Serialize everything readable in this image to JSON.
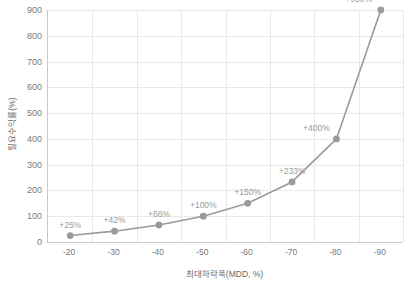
{
  "chart_data": {
    "type": "line",
    "title": "",
    "xlabel": "최대하락폭(MDD, %)",
    "ylabel": "필요수익률(%)",
    "categories": [
      "-20",
      "-30",
      "-40",
      "-50",
      "-60",
      "-70",
      "-80",
      "-90"
    ],
    "x": [
      -20,
      -30,
      -40,
      -50,
      -60,
      -70,
      -80,
      -90
    ],
    "values": [
      25,
      42,
      66,
      100,
      150,
      233,
      400,
      900
    ],
    "point_labels": [
      "+25%",
      "+42%",
      "+66%",
      "+100%",
      "+150%",
      "+233%",
      "+400%",
      "+900%"
    ],
    "ylim": [
      0,
      900
    ],
    "yticks": [
      0,
      100,
      200,
      300,
      400,
      500,
      600,
      700,
      800,
      900
    ],
    "ytick_labels": [
      "0",
      "100",
      "200",
      "300",
      "400",
      "500",
      "600",
      "700",
      "800",
      "900"
    ],
    "xticks": [
      -20,
      -30,
      -40,
      -50,
      -60,
      -70,
      -80,
      -90
    ],
    "grid": true,
    "legend": false,
    "series_color": "#9a9a9a",
    "marker_color": "#9a9a9a",
    "gridline_color": "#e8e8e8",
    "axis_color": "#c9c9c9",
    "text_color": "#7a7a7a"
  }
}
